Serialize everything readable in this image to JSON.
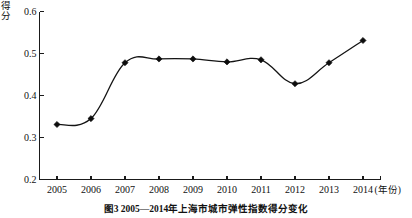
{
  "figure": {
    "caption": "图3  2005—2014年上海市城市弹性指数得分变化",
    "y_axis_title": "得分",
    "x_axis_unit": "(年份)"
  },
  "chart_data": {
    "type": "line",
    "title": "",
    "xlabel": "年份",
    "ylabel": "得分",
    "categories": [
      "2005",
      "2006",
      "2007",
      "2008",
      "2009",
      "2010",
      "2011",
      "2012",
      "2013",
      "2014"
    ],
    "values": [
      0.331,
      0.345,
      0.478,
      0.487,
      0.487,
      0.48,
      0.485,
      0.428,
      0.478,
      0.531
    ],
    "x": [
      2005,
      2006,
      2007,
      2008,
      2009,
      2010,
      2011,
      2012,
      2013,
      2014
    ],
    "ylim": [
      0.2,
      0.6
    ],
    "xlim": [
      2004.6,
      2014.4
    ],
    "yticks": [
      0.2,
      0.3,
      0.4,
      0.5,
      0.6
    ],
    "ytick_labels": [
      "0.2",
      "0.3",
      "0.4",
      "0.5",
      "0.6"
    ],
    "xtick_labels": [
      "2005",
      "2006",
      "2007",
      "2008",
      "2009",
      "2010",
      "2011",
      "2012",
      "2014"
    ],
    "grid": false,
    "legend": null,
    "marker": "diamond",
    "line_color": "#141414",
    "marker_color": "#0d0d0d"
  }
}
